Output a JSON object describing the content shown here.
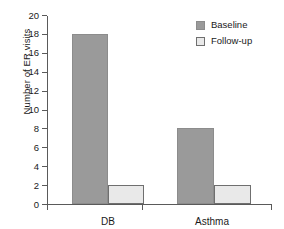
{
  "chart_data": {
    "type": "bar",
    "title": "",
    "xlabel": "",
    "ylabel": "Number of ER visits",
    "categories": [
      "DB",
      "Asthma"
    ],
    "series": [
      {
        "name": "Baseline",
        "values": [
          18,
          8
        ],
        "color": "#9a9a9a"
      },
      {
        "name": "Follow-up",
        "values": [
          2,
          2
        ],
        "color": "#e9e9e9"
      }
    ],
    "ylim": [
      0,
      20
    ],
    "ytick_values": [
      0,
      2,
      4,
      6,
      8,
      10,
      12,
      14,
      16,
      18,
      20
    ],
    "ytick_labels": [
      "0",
      "2",
      "4",
      "6",
      "8",
      "10",
      "12",
      "14",
      "16",
      "18",
      "20"
    ],
    "grid": false,
    "legend_position": "top-right",
    "axis_color": "#5a5a5a"
  },
  "legend": {
    "items": [
      {
        "label": "Baseline",
        "swatch": "baseline-swatch"
      },
      {
        "label": "Follow-up",
        "swatch": "followup-swatch"
      }
    ]
  },
  "axes": {
    "y_title": "Number of ER visits"
  }
}
